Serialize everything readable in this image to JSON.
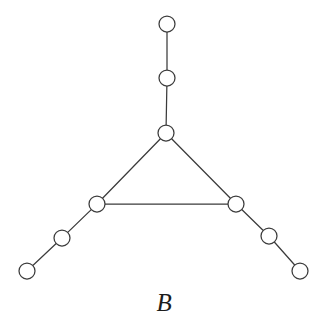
{
  "figure": {
    "caption": "B",
    "background_color": "#ffffff",
    "stroke_color": "#3b3b3b",
    "node_fill_color": "#ffffff",
    "caption_color": "#1c1c1c",
    "width": 329,
    "height": 331
  },
  "chart_data": {
    "type": "diagram",
    "title": "B",
    "node_radius": 8,
    "node_count": 9,
    "edge_count": 9,
    "nodes": [
      {
        "id": "t2",
        "label": "",
        "x": 167,
        "y": 24
      },
      {
        "id": "t1",
        "label": "",
        "x": 167,
        "y": 78
      },
      {
        "id": "hub",
        "label": "",
        "x": 166,
        "y": 133
      },
      {
        "id": "left",
        "label": "",
        "x": 97,
        "y": 204
      },
      {
        "id": "right",
        "label": "",
        "x": 236,
        "y": 204
      },
      {
        "id": "l1",
        "label": "",
        "x": 62,
        "y": 238
      },
      {
        "id": "l2",
        "label": "",
        "x": 27,
        "y": 271
      },
      {
        "id": "r1",
        "label": "",
        "x": 269,
        "y": 236
      },
      {
        "id": "r2",
        "label": "",
        "x": 300,
        "y": 271
      }
    ],
    "edges": [
      {
        "source": "t2",
        "target": "t1"
      },
      {
        "source": "t1",
        "target": "hub"
      },
      {
        "source": "hub",
        "target": "left"
      },
      {
        "source": "hub",
        "target": "right"
      },
      {
        "source": "left",
        "target": "right"
      },
      {
        "source": "left",
        "target": "l1"
      },
      {
        "source": "l1",
        "target": "l2"
      },
      {
        "source": "right",
        "target": "r1"
      },
      {
        "source": "r1",
        "target": "r2"
      }
    ]
  }
}
